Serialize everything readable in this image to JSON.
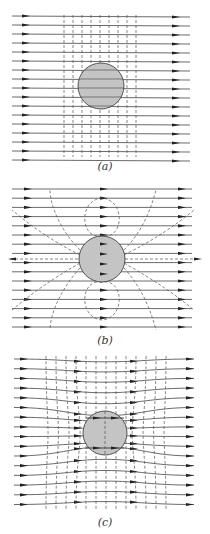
{
  "figure": {
    "panels": [
      {
        "id": "a",
        "caption": "(a)",
        "description": "Uniform field lines passing through a sphere with dashed equipotential lines"
      },
      {
        "id": "b",
        "caption": "(b)",
        "description": "Uniform field plus dipole field lines (dashed) emanating from the sphere"
      },
      {
        "id": "c",
        "caption": "(c)",
        "description": "Resultant field lines bent around the sphere with distorted equipotentials"
      }
    ]
  },
  "colors": {
    "line": "#444444",
    "sphere": "#c4c4c4",
    "background": "#ffffff"
  }
}
